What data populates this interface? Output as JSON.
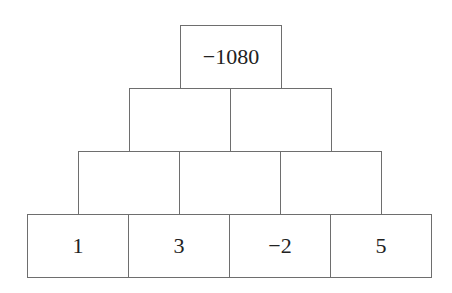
{
  "pyramid": {
    "rows": [
      [
        "−1080"
      ],
      [
        "",
        ""
      ],
      [
        "",
        "",
        ""
      ],
      [
        "1",
        "3",
        "−2",
        "5"
      ]
    ]
  },
  "colors": {
    "border": "#6e6e6e",
    "text": "#222222",
    "background": "#ffffff"
  }
}
